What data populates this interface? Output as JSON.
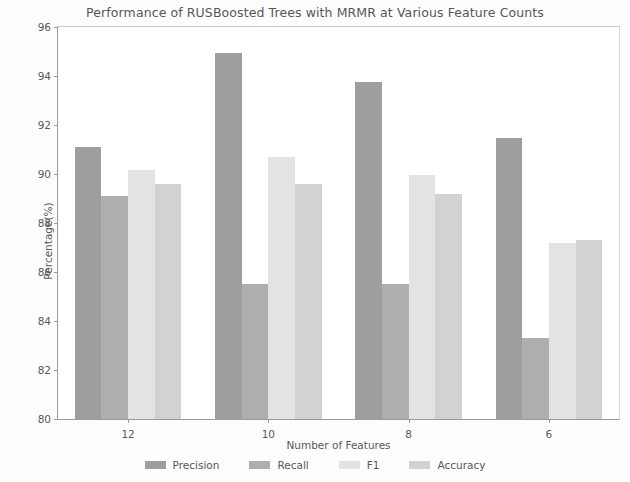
{
  "chart_data": {
    "type": "bar",
    "title": "Performance of RUSBoosted Trees with MRMR at Various Feature Counts",
    "xlabel": "Number of Features",
    "ylabel": "Percentage(%)",
    "categories": [
      "12",
      "10",
      "8",
      "6"
    ],
    "ylim": [
      80,
      96
    ],
    "yticks": [
      "80",
      "82",
      "84",
      "86",
      "88",
      "90",
      "92",
      "94",
      "96"
    ],
    "grid": false,
    "legend_position": "bottom",
    "series": [
      {
        "name": "Precision",
        "color": "#9e9e9e",
        "values": [
          91.1,
          94.95,
          93.75,
          91.45
        ]
      },
      {
        "name": "Recall",
        "color": "#aeaeae",
        "values": [
          89.1,
          85.5,
          85.5,
          83.3
        ]
      },
      {
        "name": "F1",
        "color": "#e3e3e3",
        "values": [
          90.15,
          90.7,
          89.95,
          87.2
        ]
      },
      {
        "name": "Accuracy",
        "color": "#d2d2d2",
        "values": [
          89.6,
          89.6,
          89.2,
          87.3
        ]
      }
    ]
  }
}
